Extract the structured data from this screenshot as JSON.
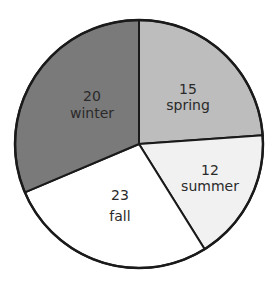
{
  "chart_data": {
    "type": "pie",
    "title": "",
    "categories": [
      "spring",
      "summer",
      "fall",
      "winter"
    ],
    "values": [
      15,
      12,
      23,
      20
    ],
    "slices": [
      {
        "label": "spring",
        "value": 15,
        "value_text": "15",
        "color": "#bdbdbd",
        "start_deg": 0,
        "end_deg": 86,
        "label_x": 188,
        "label_y_value": 94,
        "label_y_name": 110
      },
      {
        "label": "summer",
        "value": 12,
        "value_text": "12",
        "color": "#f1f1f1",
        "start_deg": 86,
        "end_deg": 148,
        "label_x": 210,
        "label_y_value": 175,
        "label_y_name": 191
      },
      {
        "label": "fall",
        "value": 23,
        "value_text": "23",
        "color": "#ffffff",
        "start_deg": 148,
        "end_deg": 247,
        "label_x": 120,
        "label_y_value": 200,
        "label_y_name": 221
      },
      {
        "label": "winter",
        "value": 20,
        "value_text": "20",
        "color": "#7a7a7a",
        "start_deg": 247,
        "end_deg": 360,
        "label_x": 92,
        "label_y_value": 101,
        "label_y_name": 118
      }
    ],
    "legend": null,
    "center": [
      139,
      144
    ],
    "radius": 124,
    "outline_color": "#1a1a1a"
  }
}
